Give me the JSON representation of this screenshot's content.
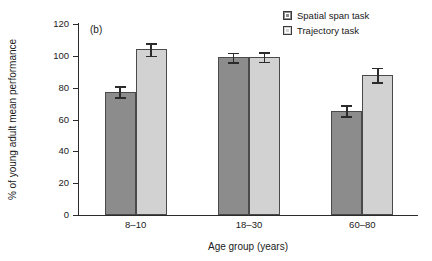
{
  "panel": {
    "label": "(b)"
  },
  "legend": {
    "position": "top-right",
    "entries": [
      {
        "label": "Spatial span task",
        "color": "#8c8c8c",
        "swatch": "dark-gray-square"
      },
      {
        "label": "Trajectory task",
        "color": "#d2d2d2",
        "swatch": "light-gray-square"
      }
    ]
  },
  "axes": {
    "y_label": "% of young adult mean performance",
    "x_label": "Age group (years)",
    "y_ticks": [
      "0",
      "20",
      "40",
      "60",
      "80",
      "100",
      "120"
    ],
    "x_ticks": [
      "8–10",
      "18–30",
      "60–80"
    ]
  },
  "chart_data": {
    "type": "bar",
    "title": "(b)",
    "xlabel": "Age group (years)",
    "ylabel": "% of young adult mean performance",
    "categories": [
      "8–10",
      "18–30",
      "60–80"
    ],
    "ylim": [
      0,
      120
    ],
    "ytick_step": 20,
    "grid": false,
    "legend_position": "top-right",
    "series": [
      {
        "name": "Spatial span task",
        "color": "#8c8c8c",
        "values": [
          77.5,
          99.0,
          65.5
        ],
        "errors": [
          3.5,
          3.0,
          3.5
        ]
      },
      {
        "name": "Trajectory task",
        "color": "#d2d2d2",
        "values": [
          104.0,
          99.2,
          88.0
        ],
        "errors": [
          4.0,
          3.0,
          4.5
        ]
      }
    ]
  }
}
